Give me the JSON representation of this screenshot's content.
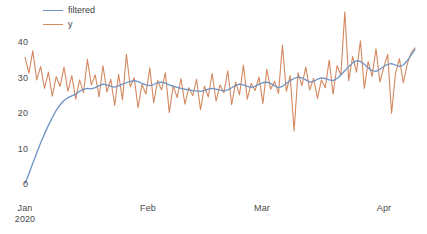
{
  "chart_data": {
    "type": "line",
    "title": "",
    "xlabel": "",
    "ylabel": "",
    "grid": false,
    "legend_position": "top-left",
    "ylim": [
      0,
      49
    ],
    "yticks": [
      0,
      10,
      20,
      30,
      40
    ],
    "ytick_labels": [
      "0",
      "10",
      "20",
      "30",
      "40"
    ],
    "xtick_labels": [
      "Jan\n2020",
      "Feb",
      "Mar",
      "Apr"
    ],
    "xtick_primary": [
      "Jan",
      "Feb",
      "Mar",
      "Apr"
    ],
    "xtick_secondary": [
      "2020",
      "",
      "",
      ""
    ],
    "xlim_start": "2020-01-01",
    "xlim_end": "2020-04-10",
    "n_points": 101,
    "series": [
      {
        "name": "filtered",
        "color": "#6e94c4",
        "values": [
          0.4,
          3.2,
          6.1,
          9.0,
          11.8,
          14.4,
          16.8,
          19.0,
          21.0,
          22.6,
          23.8,
          24.6,
          25.1,
          25.6,
          26.4,
          27.0,
          27.2,
          27.1,
          27.4,
          28.0,
          28.4,
          28.2,
          27.8,
          27.6,
          27.9,
          28.4,
          28.8,
          29.2,
          29.4,
          29.1,
          28.6,
          28.2,
          28.0,
          28.3,
          28.8,
          29.0,
          28.7,
          28.2,
          27.8,
          27.5,
          27.2,
          27.0,
          26.8,
          26.6,
          26.5,
          26.4,
          26.6,
          27.0,
          27.2,
          27.0,
          26.7,
          26.5,
          26.8,
          27.4,
          28.0,
          28.4,
          28.2,
          27.8,
          27.5,
          27.8,
          28.4,
          28.8,
          29.0,
          28.6,
          28.0,
          27.4,
          27.8,
          28.6,
          29.4,
          30.0,
          30.4,
          30.2,
          29.6,
          29.0,
          29.2,
          29.8,
          30.2,
          30.0,
          29.6,
          29.4,
          30.0,
          31.0,
          32.2,
          33.4,
          34.4,
          35.0,
          34.8,
          34.0,
          33.0,
          32.2,
          32.0,
          32.6,
          33.4,
          34.0,
          34.2,
          33.8,
          33.4,
          33.8,
          35.0,
          36.6,
          38.2
        ]
      },
      {
        "name": "y",
        "color": "#d3885f",
        "values": [
          36.0,
          31.5,
          37.8,
          29.6,
          33.4,
          27.2,
          31.8,
          25.0,
          30.5,
          27.8,
          33.2,
          26.4,
          30.8,
          24.2,
          29.6,
          26.0,
          35.4,
          28.2,
          31.0,
          24.8,
          33.6,
          26.2,
          29.8,
          22.4,
          31.2,
          24.0,
          36.8,
          27.6,
          30.2,
          21.8,
          28.4,
          25.6,
          33.0,
          23.2,
          29.4,
          26.8,
          31.6,
          20.4,
          28.0,
          24.6,
          30.0,
          22.8,
          27.4,
          25.2,
          29.8,
          21.2,
          27.8,
          24.8,
          31.4,
          23.6,
          28.2,
          26.0,
          32.2,
          22.6,
          29.0,
          25.4,
          33.8,
          24.2,
          28.6,
          26.6,
          30.4,
          23.0,
          32.6,
          27.0,
          29.2,
          25.8,
          39.4,
          26.4,
          30.8,
          15.2,
          31.6,
          28.0,
          33.2,
          26.8,
          30.0,
          24.4,
          29.6,
          27.4,
          35.2,
          25.6,
          33.6,
          31.0,
          48.8,
          29.4,
          36.2,
          31.8,
          40.6,
          27.2,
          34.8,
          30.6,
          38.4,
          29.0,
          33.2,
          36.8,
          20.2,
          31.4,
          35.6,
          28.8,
          34.0,
          37.2,
          38.6
        ]
      }
    ]
  },
  "legend": {
    "items": [
      {
        "label": "filtered",
        "color": "#6e94c4"
      },
      {
        "label": "y",
        "color": "#d3885f"
      }
    ]
  },
  "axis": {
    "y_labels": [
      "40",
      "30",
      "20",
      "10",
      "0"
    ],
    "x_labels_primary": [
      "Jan",
      "Feb",
      "Mar",
      "Apr"
    ],
    "x_label_year": "2020"
  }
}
